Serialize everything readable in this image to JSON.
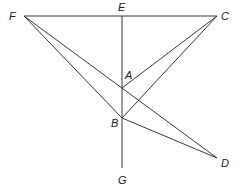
{
  "diagram": {
    "points": [
      {
        "id": "F",
        "label": "F",
        "x": 24,
        "y": 16
      },
      {
        "id": "E",
        "label": "E",
        "x": 122,
        "y": 16
      },
      {
        "id": "C",
        "label": "C",
        "x": 217,
        "y": 16
      },
      {
        "id": "A",
        "label": "A",
        "x": 122,
        "y": 88
      },
      {
        "id": "B",
        "label": "B",
        "x": 122,
        "y": 118
      },
      {
        "id": "D",
        "label": "D",
        "x": 217,
        "y": 158
      },
      {
        "id": "G",
        "label": "G",
        "x": 122,
        "y": 168
      }
    ],
    "segments": [
      [
        "F",
        "C"
      ],
      [
        "E",
        "G"
      ],
      [
        "F",
        "D"
      ],
      [
        "F",
        "B"
      ],
      [
        "C",
        "A"
      ],
      [
        "C",
        "B"
      ],
      [
        "B",
        "D"
      ]
    ],
    "labels": {
      "F": "F",
      "E": "E",
      "C": "C",
      "A": "A",
      "B": "B",
      "D": "D",
      "G": "G"
    },
    "line_color": "#3a3a3a"
  }
}
